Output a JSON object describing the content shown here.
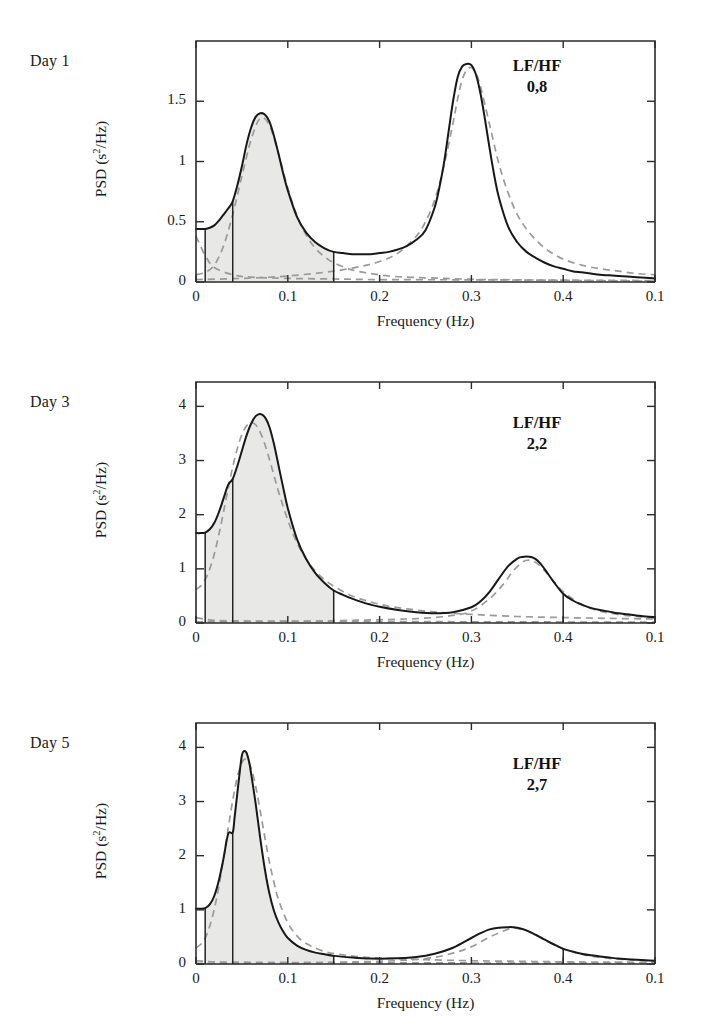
{
  "figure": {
    "type": "multi-panel-spectrum",
    "panel_count": 3,
    "background_color": "#ffffff",
    "line_color": "#181818",
    "component_color": "#9a9a9a",
    "band_fill_color": "#e8e8e6"
  },
  "axes": {
    "xlabel": "Frequency (Hz)",
    "ylabel_text": "PSD (s",
    "ylabel_sup": "2",
    "ylabel_tail": "/Hz)",
    "ylabel_full": "PSD (s2/Hz)",
    "x_tick_labels": [
      "0",
      "0.1",
      "0.2",
      "0.3",
      "0.4",
      "0.1"
    ],
    "x_tick_values": [
      0,
      0.1,
      0.2,
      0.3,
      0.4,
      0.5
    ],
    "xlim": [
      0,
      0.5
    ],
    "grid": false
  },
  "chart_data": [
    {
      "type": "line",
      "title": "Day 1",
      "xlabel": "Frequency (Hz)",
      "ylabel": "PSD (s2/Hz)",
      "xlim": [
        0,
        0.5
      ],
      "ylim": [
        0,
        2.0
      ],
      "y_tick_labels": [
        "0",
        "0.5",
        "1",
        "1.5"
      ],
      "y_tick_values": [
        0,
        0.5,
        1,
        1.5
      ],
      "annotation_label": "LF/HF",
      "annotation_value": "0,8",
      "lf_hf_ratio": 0.8,
      "band_boundaries_hz": [
        0.01,
        0.04,
        0.15
      ],
      "shaded_band_hz": [
        0.01,
        0.15
      ],
      "series": [
        {
          "name": "total-spectrum",
          "style": "solid",
          "x": [
            0.0,
            0.005,
            0.01,
            0.015,
            0.02,
            0.025,
            0.03,
            0.035,
            0.04,
            0.045,
            0.05,
            0.055,
            0.06,
            0.065,
            0.07,
            0.075,
            0.08,
            0.085,
            0.09,
            0.095,
            0.1,
            0.11,
            0.12,
            0.13,
            0.14,
            0.15,
            0.16,
            0.17,
            0.18,
            0.19,
            0.2,
            0.21,
            0.22,
            0.23,
            0.24,
            0.25,
            0.26,
            0.265,
            0.27,
            0.275,
            0.28,
            0.285,
            0.29,
            0.295,
            0.3,
            0.305,
            0.31,
            0.315,
            0.32,
            0.325,
            0.33,
            0.34,
            0.35,
            0.36,
            0.37,
            0.38,
            0.39,
            0.4,
            0.41,
            0.42,
            0.43,
            0.44,
            0.45,
            0.46,
            0.47,
            0.48,
            0.49,
            0.5
          ],
          "y": [
            0.44,
            0.44,
            0.44,
            0.45,
            0.47,
            0.51,
            0.56,
            0.61,
            0.67,
            0.8,
            0.96,
            1.14,
            1.28,
            1.37,
            1.4,
            1.39,
            1.33,
            1.21,
            1.06,
            0.9,
            0.76,
            0.54,
            0.41,
            0.33,
            0.28,
            0.25,
            0.24,
            0.23,
            0.23,
            0.23,
            0.24,
            0.25,
            0.27,
            0.3,
            0.35,
            0.43,
            0.62,
            0.78,
            0.98,
            1.24,
            1.5,
            1.7,
            1.79,
            1.81,
            1.8,
            1.72,
            1.56,
            1.34,
            1.1,
            0.88,
            0.7,
            0.46,
            0.33,
            0.25,
            0.2,
            0.16,
            0.13,
            0.11,
            0.09,
            0.08,
            0.07,
            0.06,
            0.055,
            0.05,
            0.045,
            0.04,
            0.035,
            0.03
          ]
        },
        {
          "name": "lf-component",
          "style": "dashed",
          "x": [
            0.0,
            0.01,
            0.02,
            0.03,
            0.04,
            0.05,
            0.06,
            0.07,
            0.08,
            0.09,
            0.1,
            0.11,
            0.12,
            0.13,
            0.14,
            0.15,
            0.17,
            0.19,
            0.21,
            0.23,
            0.25,
            0.27,
            0.29,
            0.31,
            0.33,
            0.35,
            0.4,
            0.45,
            0.5
          ],
          "y": [
            0.06,
            0.08,
            0.14,
            0.3,
            0.56,
            0.88,
            1.18,
            1.36,
            1.3,
            1.06,
            0.78,
            0.55,
            0.39,
            0.28,
            0.21,
            0.16,
            0.1,
            0.07,
            0.05,
            0.04,
            0.035,
            0.03,
            0.025,
            0.02,
            0.02,
            0.018,
            0.014,
            0.01,
            0.008
          ]
        },
        {
          "name": "hf-component",
          "style": "dashed",
          "x": [
            0.0,
            0.05,
            0.1,
            0.15,
            0.18,
            0.2,
            0.22,
            0.24,
            0.25,
            0.26,
            0.27,
            0.28,
            0.285,
            0.29,
            0.295,
            0.3,
            0.305,
            0.31,
            0.32,
            0.33,
            0.34,
            0.35,
            0.36,
            0.37,
            0.38,
            0.39,
            0.4,
            0.42,
            0.44,
            0.46,
            0.48,
            0.5
          ],
          "y": [
            0.02,
            0.03,
            0.05,
            0.09,
            0.13,
            0.17,
            0.24,
            0.38,
            0.5,
            0.68,
            0.96,
            1.32,
            1.52,
            1.68,
            1.76,
            1.78,
            1.73,
            1.62,
            1.3,
            0.98,
            0.74,
            0.56,
            0.44,
            0.35,
            0.28,
            0.23,
            0.19,
            0.14,
            0.11,
            0.09,
            0.07,
            0.06
          ]
        },
        {
          "name": "vlf-baseline",
          "style": "dashed",
          "x": [
            0.0,
            0.01,
            0.02,
            0.04,
            0.06,
            0.1,
            0.15,
            0.2,
            0.3,
            0.4,
            0.5
          ],
          "y": [
            0.38,
            0.22,
            0.12,
            0.06,
            0.04,
            0.03,
            0.025,
            0.02,
            0.018,
            0.015,
            0.012
          ]
        }
      ]
    },
    {
      "type": "line",
      "title": "Day 3",
      "xlabel": "Frequency (Hz)",
      "ylabel": "PSD (s2/Hz)",
      "xlim": [
        0,
        0.5
      ],
      "ylim": [
        0,
        4.45
      ],
      "y_tick_labels": [
        "0",
        "1",
        "2",
        "3",
        "4"
      ],
      "y_tick_values": [
        0,
        1,
        2,
        3,
        4
      ],
      "annotation_label": "LF/HF",
      "annotation_value": "2,2",
      "lf_hf_ratio": 2.2,
      "band_boundaries_hz": [
        0.01,
        0.04,
        0.15,
        0.4
      ],
      "shaded_band_hz": [
        0.01,
        0.15
      ],
      "series": [
        {
          "name": "total-spectrum",
          "style": "solid",
          "x": [
            0.0,
            0.005,
            0.01,
            0.015,
            0.02,
            0.025,
            0.03,
            0.035,
            0.04,
            0.045,
            0.05,
            0.055,
            0.06,
            0.065,
            0.07,
            0.075,
            0.08,
            0.085,
            0.09,
            0.095,
            0.1,
            0.11,
            0.12,
            0.13,
            0.14,
            0.15,
            0.16,
            0.17,
            0.18,
            0.19,
            0.2,
            0.22,
            0.24,
            0.26,
            0.28,
            0.3,
            0.31,
            0.32,
            0.33,
            0.34,
            0.35,
            0.355,
            0.36,
            0.365,
            0.37,
            0.375,
            0.38,
            0.39,
            0.4,
            0.41,
            0.42,
            0.43,
            0.44,
            0.45,
            0.46,
            0.47,
            0.48,
            0.49,
            0.5
          ],
          "y": [
            1.66,
            1.66,
            1.67,
            1.73,
            1.85,
            2.05,
            2.3,
            2.55,
            2.66,
            2.9,
            3.18,
            3.46,
            3.68,
            3.82,
            3.86,
            3.8,
            3.62,
            3.3,
            2.9,
            2.5,
            2.12,
            1.55,
            1.18,
            0.92,
            0.74,
            0.6,
            0.52,
            0.45,
            0.39,
            0.34,
            0.3,
            0.24,
            0.2,
            0.18,
            0.2,
            0.29,
            0.4,
            0.58,
            0.82,
            1.05,
            1.19,
            1.22,
            1.23,
            1.22,
            1.18,
            1.1,
            0.99,
            0.75,
            0.54,
            0.42,
            0.34,
            0.28,
            0.24,
            0.21,
            0.18,
            0.16,
            0.14,
            0.12,
            0.11
          ]
        },
        {
          "name": "lf-component",
          "style": "dashed",
          "x": [
            0.0,
            0.005,
            0.01,
            0.015,
            0.02,
            0.025,
            0.03,
            0.035,
            0.04,
            0.045,
            0.05,
            0.055,
            0.06,
            0.065,
            0.07,
            0.075,
            0.08,
            0.085,
            0.09,
            0.1,
            0.11,
            0.12,
            0.13,
            0.14,
            0.15,
            0.17,
            0.19,
            0.21,
            0.23,
            0.25,
            0.27,
            0.3,
            0.35,
            0.4,
            0.45,
            0.5
          ],
          "y": [
            0.62,
            0.68,
            0.8,
            1.0,
            1.28,
            1.64,
            2.05,
            2.48,
            2.88,
            3.22,
            3.48,
            3.64,
            3.7,
            3.66,
            3.52,
            3.3,
            3.02,
            2.72,
            2.42,
            1.9,
            1.48,
            1.18,
            0.96,
            0.8,
            0.68,
            0.5,
            0.39,
            0.31,
            0.26,
            0.22,
            0.19,
            0.16,
            0.12,
            0.1,
            0.085,
            0.075
          ]
        },
        {
          "name": "hf-component",
          "style": "dashed",
          "x": [
            0.0,
            0.1,
            0.2,
            0.25,
            0.28,
            0.3,
            0.32,
            0.335,
            0.345,
            0.355,
            0.362,
            0.37,
            0.38,
            0.39,
            0.4,
            0.42,
            0.44,
            0.46,
            0.48,
            0.5
          ],
          "y": [
            0.02,
            0.03,
            0.06,
            0.09,
            0.14,
            0.22,
            0.45,
            0.72,
            0.95,
            1.12,
            1.16,
            1.12,
            0.96,
            0.76,
            0.58,
            0.34,
            0.22,
            0.16,
            0.12,
            0.09
          ]
        },
        {
          "name": "vlf-baseline",
          "style": "dashed",
          "x": [
            0.0,
            0.01,
            0.02,
            0.04,
            0.08,
            0.15,
            0.25,
            0.35,
            0.45,
            0.5
          ],
          "y": [
            0.1,
            0.07,
            0.05,
            0.04,
            0.035,
            0.03,
            0.025,
            0.02,
            0.018,
            0.015
          ]
        }
      ]
    },
    {
      "type": "line",
      "title": "Day 5",
      "xlabel": "Frequency (Hz)",
      "ylabel": "PSD (s2/Hz)",
      "xlim": [
        0,
        0.5
      ],
      "ylim": [
        0,
        4.45
      ],
      "y_tick_labels": [
        "0",
        "1",
        "2",
        "3",
        "4"
      ],
      "y_tick_values": [
        0,
        1,
        2,
        3,
        4
      ],
      "annotation_label": "LF/HF",
      "annotation_value": "2,7",
      "lf_hf_ratio": 2.7,
      "band_boundaries_hz": [
        0.01,
        0.04,
        0.15,
        0.4
      ],
      "shaded_band_hz": [
        0.01,
        0.15
      ],
      "series": [
        {
          "name": "total-spectrum",
          "style": "solid",
          "x": [
            0.0,
            0.005,
            0.01,
            0.015,
            0.02,
            0.025,
            0.03,
            0.035,
            0.04,
            0.042,
            0.045,
            0.048,
            0.05,
            0.052,
            0.055,
            0.058,
            0.06,
            0.065,
            0.07,
            0.075,
            0.08,
            0.085,
            0.09,
            0.095,
            0.1,
            0.11,
            0.12,
            0.13,
            0.14,
            0.15,
            0.17,
            0.19,
            0.21,
            0.24,
            0.26,
            0.28,
            0.3,
            0.31,
            0.32,
            0.33,
            0.34,
            0.345,
            0.35,
            0.36,
            0.37,
            0.38,
            0.39,
            0.4,
            0.41,
            0.42,
            0.43,
            0.44,
            0.45,
            0.46,
            0.47,
            0.48,
            0.49,
            0.5
          ],
          "y": [
            1.02,
            1.02,
            1.03,
            1.1,
            1.26,
            1.55,
            1.95,
            2.4,
            2.43,
            2.7,
            3.15,
            3.6,
            3.85,
            3.93,
            3.9,
            3.72,
            3.52,
            2.96,
            2.32,
            1.75,
            1.3,
            0.98,
            0.76,
            0.6,
            0.48,
            0.34,
            0.26,
            0.21,
            0.18,
            0.15,
            0.12,
            0.1,
            0.1,
            0.13,
            0.19,
            0.3,
            0.48,
            0.57,
            0.64,
            0.67,
            0.68,
            0.68,
            0.67,
            0.62,
            0.54,
            0.45,
            0.36,
            0.28,
            0.23,
            0.19,
            0.16,
            0.14,
            0.12,
            0.1,
            0.09,
            0.08,
            0.07,
            0.06
          ]
        },
        {
          "name": "lf-component",
          "style": "dashed",
          "x": [
            0.0,
            0.005,
            0.01,
            0.015,
            0.02,
            0.025,
            0.03,
            0.035,
            0.04,
            0.045,
            0.05,
            0.055,
            0.06,
            0.065,
            0.07,
            0.075,
            0.08,
            0.085,
            0.09,
            0.1,
            0.11,
            0.12,
            0.14,
            0.16,
            0.18,
            0.2,
            0.25,
            0.3,
            0.35,
            0.4,
            0.45,
            0.5
          ],
          "y": [
            0.3,
            0.36,
            0.48,
            0.7,
            1.02,
            1.44,
            1.95,
            2.5,
            3.02,
            3.45,
            3.72,
            3.78,
            3.62,
            3.28,
            2.82,
            2.34,
            1.88,
            1.5,
            1.18,
            0.76,
            0.52,
            0.38,
            0.23,
            0.17,
            0.13,
            0.11,
            0.08,
            0.06,
            0.05,
            0.04,
            0.035,
            0.03
          ]
        },
        {
          "name": "hf-component",
          "style": "dashed",
          "x": [
            0.0,
            0.1,
            0.2,
            0.25,
            0.28,
            0.3,
            0.32,
            0.335,
            0.345,
            0.355,
            0.365,
            0.38,
            0.39,
            0.4,
            0.42,
            0.44,
            0.46,
            0.48,
            0.5
          ],
          "y": [
            0.01,
            0.02,
            0.05,
            0.1,
            0.2,
            0.32,
            0.5,
            0.61,
            0.66,
            0.64,
            0.58,
            0.44,
            0.36,
            0.28,
            0.18,
            0.12,
            0.09,
            0.07,
            0.05
          ]
        },
        {
          "name": "vlf-baseline",
          "style": "dashed",
          "x": [
            0.0,
            0.01,
            0.02,
            0.04,
            0.08,
            0.15,
            0.25,
            0.35,
            0.45,
            0.5
          ],
          "y": [
            0.06,
            0.05,
            0.04,
            0.035,
            0.03,
            0.025,
            0.02,
            0.018,
            0.015,
            0.012
          ]
        }
      ]
    }
  ]
}
